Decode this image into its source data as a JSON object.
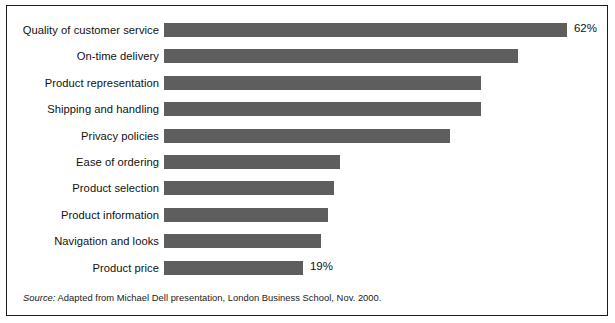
{
  "figure": {
    "frame_color": "#1b1b1b",
    "background_color": "#ffffff"
  },
  "source": {
    "label": "Source:",
    "text": " Adapted from Michael Dell presentation, London Business School, Nov. 2000."
  },
  "chart_data": {
    "type": "bar",
    "orientation": "horizontal",
    "title": "",
    "subtitle": "",
    "xlabel": "",
    "ylabel": "",
    "xlim": [
      0,
      65
    ],
    "grid": false,
    "legend": "none",
    "bar_color": "#5e5e5e",
    "categories": [
      "Quality of customer service",
      "On-time delivery",
      "Product representation",
      "Shipping and handling",
      "Privacy policies",
      "Ease of ordering",
      "Product selection",
      "Product information",
      "Navigation and looks",
      "Product price"
    ],
    "values": [
      62,
      54,
      48,
      48,
      43,
      25,
      24,
      23,
      22,
      19
    ],
    "value_labels": [
      "62%",
      "",
      "",
      "",
      "",
      "",
      "",
      "",
      "",
      "19%"
    ],
    "annotations": [
      {
        "category": "Quality of customer service",
        "text": "62%"
      },
      {
        "category": "Product price",
        "text": "19%"
      }
    ]
  }
}
